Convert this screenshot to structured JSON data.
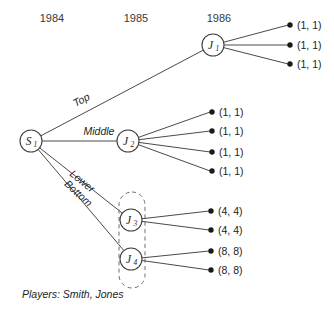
{
  "figure": {
    "type": "game-tree",
    "players_note": "Players: Smith, Jones"
  },
  "timeline": {
    "years": [
      {
        "label": "1984",
        "x": 52,
        "y": 22
      },
      {
        "label": "1985",
        "x": 136,
        "y": 22
      },
      {
        "label": "1986",
        "x": 219,
        "y": 22
      }
    ]
  },
  "nodes": [
    {
      "id": "S1",
      "letter": "S",
      "sub": "1",
      "x": 31,
      "y": 141,
      "r": 11
    },
    {
      "id": "J1",
      "letter": "J",
      "sub": "1",
      "x": 213,
      "y": 45,
      "r": 11
    },
    {
      "id": "J2",
      "letter": "J",
      "sub": "2",
      "x": 128,
      "y": 141,
      "r": 11
    },
    {
      "id": "J3",
      "letter": "J",
      "sub": "3",
      "x": 131,
      "y": 220,
      "r": 11
    },
    {
      "id": "J4",
      "letter": "J",
      "sub": "4",
      "x": 131,
      "y": 259,
      "r": 11
    }
  ],
  "edges": [
    {
      "from": "S1",
      "to": "J1",
      "label": "Top",
      "label_x": 83,
      "label_y": 103,
      "label_rot": -28
    },
    {
      "from": "S1",
      "to": "J2",
      "label": "Middle",
      "label_x": 99,
      "label_y": 135,
      "label_rot": 0
    },
    {
      "from": "S1",
      "to": "J3",
      "label": "Lower",
      "label_x": 80,
      "label_y": 184,
      "label_rot": 39
    },
    {
      "from": "S1",
      "to": "J4",
      "label": "Bottom",
      "label_x": 76,
      "label_y": 196,
      "label_rot": 42
    }
  ],
  "terminals": [
    {
      "parent": "J1",
      "dot_x": 290,
      "dot_y": 25,
      "payoff": "(1, 1)",
      "text_x": 297,
      "text_y": 29
    },
    {
      "parent": "J1",
      "dot_x": 290,
      "dot_y": 45,
      "payoff": "(1, 1)",
      "text_x": 297,
      "text_y": 49
    },
    {
      "parent": "J1",
      "dot_x": 290,
      "dot_y": 64,
      "payoff": "(1, 1)",
      "text_x": 297,
      "text_y": 68
    },
    {
      "parent": "J2",
      "dot_x": 212,
      "dot_y": 112,
      "payoff": "(1, 1)",
      "text_x": 219,
      "text_y": 116
    },
    {
      "parent": "J2",
      "dot_x": 212,
      "dot_y": 131,
      "payoff": "(1, 1)",
      "text_x": 219,
      "text_y": 135
    },
    {
      "parent": "J2",
      "dot_x": 212,
      "dot_y": 152,
      "payoff": "(1, 1)",
      "text_x": 219,
      "text_y": 156
    },
    {
      "parent": "J2",
      "dot_x": 212,
      "dot_y": 171,
      "payoff": "(1, 1)",
      "text_x": 219,
      "text_y": 175
    },
    {
      "parent": "J3",
      "dot_x": 211,
      "dot_y": 211,
      "payoff": "(4, 4)",
      "text_x": 218,
      "text_y": 215
    },
    {
      "parent": "J3",
      "dot_x": 211,
      "dot_y": 230,
      "payoff": "(4, 4)",
      "text_x": 218,
      "text_y": 234
    },
    {
      "parent": "J4",
      "dot_x": 211,
      "dot_y": 251,
      "payoff": "(8, 8)",
      "text_x": 218,
      "text_y": 255
    },
    {
      "parent": "J4",
      "dot_x": 211,
      "dot_y": 270,
      "payoff": "(8, 8)",
      "text_x": 218,
      "text_y": 274
    }
  ],
  "information_set": {
    "name": "jones-information-set",
    "x": 119,
    "y": 192,
    "width": 26,
    "height": 96,
    "rx": 13
  },
  "note": {
    "text": "Players: Smith, Jones",
    "x": 22,
    "y": 298
  },
  "chart_data": {
    "type": "diagram",
    "title": "",
    "decision_tree": {
      "root": "S1",
      "branches": [
        {
          "label": "Top",
          "target": "J1",
          "payoffs": [
            "(1, 1)",
            "(1, 1)",
            "(1, 1)"
          ]
        },
        {
          "label": "Middle",
          "target": "J2",
          "payoffs": [
            "(1, 1)",
            "(1, 1)",
            "(1, 1)",
            "(1, 1)"
          ]
        },
        {
          "label": "Lower",
          "target": "J3",
          "payoffs": [
            "(4, 4)",
            "(4, 4)"
          ]
        },
        {
          "label": "Bottom",
          "target": "J4",
          "payoffs": [
            "(8, 8)",
            "(8, 8)"
          ]
        }
      ],
      "time_periods": [
        "1984",
        "1985",
        "1986"
      ],
      "players": [
        "Smith",
        "Jones"
      ]
    }
  }
}
